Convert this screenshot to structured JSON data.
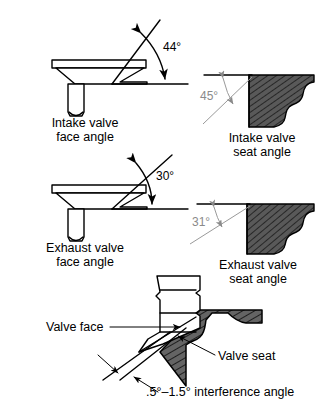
{
  "figure": {
    "colors": {
      "line": "#000000",
      "gray_line": "#9a9a9a",
      "gray_text": "#8a8a8a",
      "seat_fill": "#5a5a5a",
      "part_fill": "#ffffff",
      "background": "#ffffff"
    }
  },
  "panels": {
    "intake_face": {
      "angle_label": "44°",
      "caption_line1": "Intake valve",
      "caption_line2": "face angle"
    },
    "intake_seat": {
      "angle_label": "45°",
      "caption_line1": "Intake valve",
      "caption_line2": "seat angle"
    },
    "exhaust_face": {
      "angle_label": "30°",
      "caption_line1": "Exhaust valve",
      "caption_line2": "face angle"
    },
    "exhaust_seat": {
      "angle_label": "31°",
      "caption_line1": "Exhaust valve",
      "caption_line2": "seat angle"
    },
    "interference": {
      "valve_face_label": "Valve face",
      "valve_seat_label": "Valve seat",
      "interference_label": ".5°–1.5° interference angle"
    }
  }
}
